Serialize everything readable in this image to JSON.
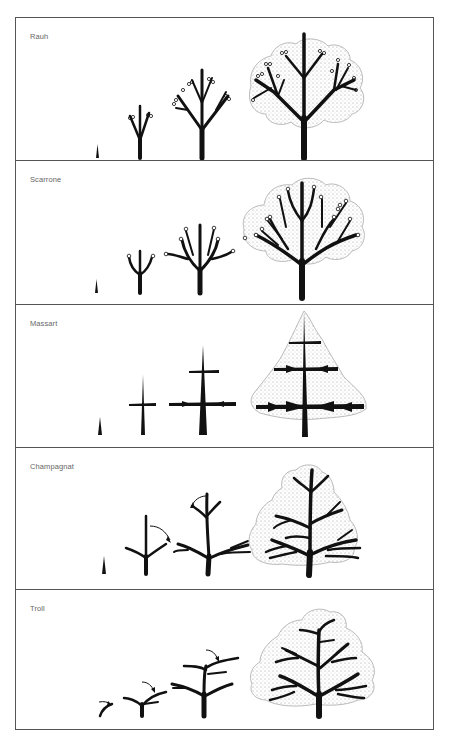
{
  "figure": {
    "panels": [
      {
        "label": "Rauh",
        "stages": 4,
        "feature": "rhythmic orthotropic branching with terminal flowers"
      },
      {
        "label": "Scarrone",
        "stages": 4,
        "feature": "orthotropic branches with terminal flowering"
      },
      {
        "label": "Massart",
        "stages": 4,
        "feature": "tiered plagiotropic branches on orthotropic trunk"
      },
      {
        "label": "Champagnat",
        "stages": 4,
        "feature": "arching axes by bending (arrows)"
      },
      {
        "label": "Troll",
        "stages": 4,
        "feature": "plagiotropic axes overlapping (arrows)"
      }
    ]
  },
  "colors": {
    "ink": "#111111",
    "border": "#555555",
    "label": "#666666",
    "canopy_stipple": "#bdbdbd"
  }
}
